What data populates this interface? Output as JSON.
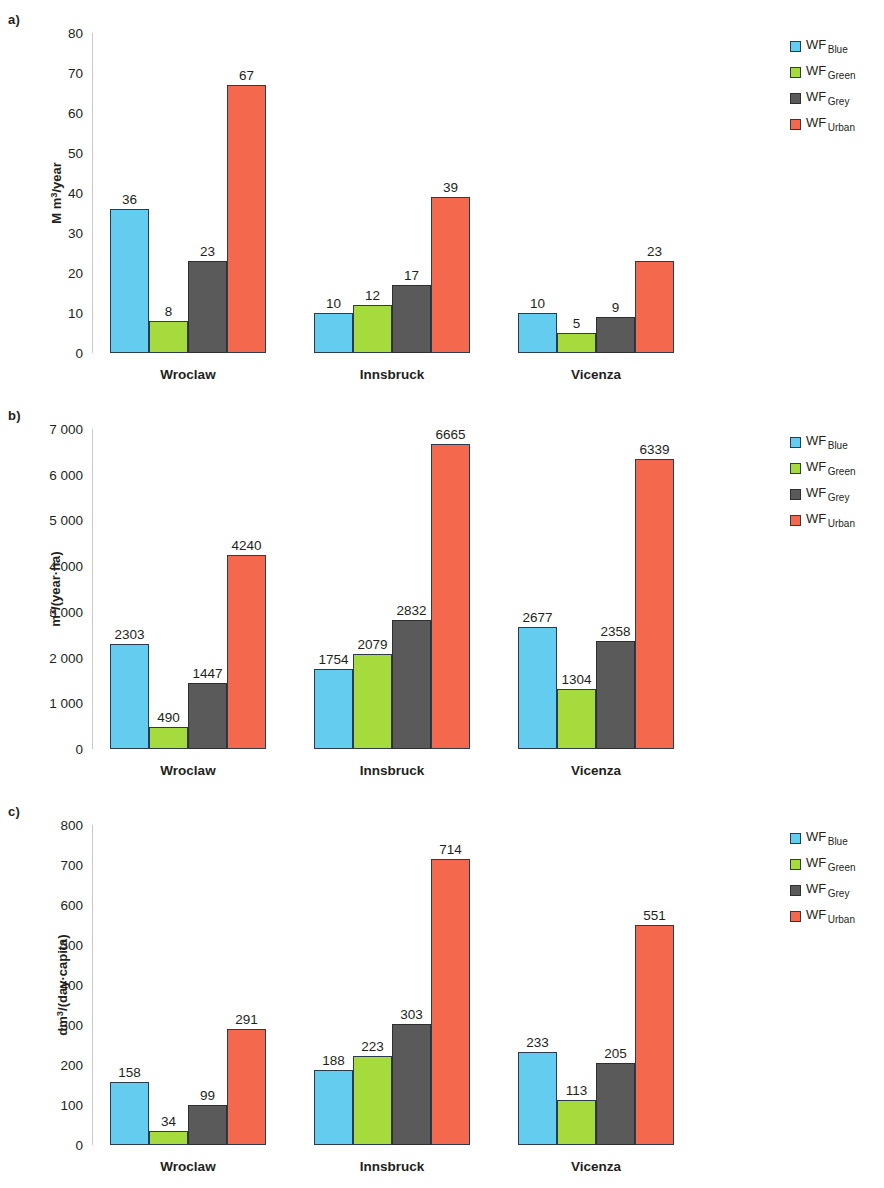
{
  "legend": {
    "position": "right",
    "items": [
      {
        "prefix": "WF",
        "subscript": "Blue",
        "color": "#63ccef",
        "key": "blue"
      },
      {
        "prefix": "WF",
        "subscript": "Green",
        "color": "#a5db3c",
        "key": "green"
      },
      {
        "prefix": "WF",
        "subscript": "Grey",
        "color": "#5a5a5a",
        "key": "grey"
      },
      {
        "prefix": "WF",
        "subscript": "Urban",
        "color": "#f4694d",
        "key": "red"
      }
    ]
  },
  "panels": [
    {
      "id": "a",
      "letter": "a)"
    },
    {
      "id": "b",
      "letter": "b)"
    },
    {
      "id": "c",
      "letter": "c)"
    }
  ],
  "chart_data": [
    {
      "type": "bar",
      "panel": "a)",
      "title": "",
      "xlabel": "",
      "ylabel": "M m³/year",
      "ylabel_parts": {
        "pre": "M m",
        "sup": "3",
        "post": "/year"
      },
      "ylim": [
        0,
        80
      ],
      "yticks": [
        0,
        10,
        20,
        30,
        40,
        50,
        60,
        70,
        80
      ],
      "ytick_labels": [
        "0",
        "10",
        "20",
        "30",
        "40",
        "50",
        "60",
        "70",
        "80"
      ],
      "grid": false,
      "legend_position": "right",
      "categories": [
        "Wroclaw",
        "Innsbruck",
        "Vicenza"
      ],
      "series": [
        {
          "name": "WF Blue",
          "color": "#63ccef",
          "values": [
            36,
            10,
            10
          ]
        },
        {
          "name": "WF Green",
          "color": "#a5db3c",
          "values": [
            8,
            12,
            5
          ]
        },
        {
          "name": "WF Grey",
          "color": "#5a5a5a",
          "values": [
            23,
            17,
            9
          ]
        },
        {
          "name": "WF Urban",
          "color": "#f4694d",
          "values": [
            67,
            39,
            23
          ]
        }
      ]
    },
    {
      "type": "bar",
      "panel": "b)",
      "title": "",
      "xlabel": "",
      "ylabel": "m³/(year·ha)",
      "ylabel_parts": {
        "pre": "m",
        "sup": "3",
        "post": "/(year·ha)"
      },
      "ylim": [
        0,
        7000
      ],
      "yticks": [
        0,
        1000,
        2000,
        3000,
        4000,
        5000,
        6000,
        7000
      ],
      "ytick_labels": [
        "0",
        "1 000",
        "2 000",
        "3 000",
        "4 000",
        "5 000",
        "6 000",
        "7 000"
      ],
      "grid": false,
      "legend_position": "right",
      "categories": [
        "Wroclaw",
        "Innsbruck",
        "Vicenza"
      ],
      "series": [
        {
          "name": "WF Blue",
          "color": "#63ccef",
          "values": [
            2303,
            1754,
            2677
          ]
        },
        {
          "name": "WF Green",
          "color": "#a5db3c",
          "values": [
            490,
            2079,
            1304
          ]
        },
        {
          "name": "WF Grey",
          "color": "#5a5a5a",
          "values": [
            1447,
            2832,
            2358
          ]
        },
        {
          "name": "WF Urban",
          "color": "#f4694d",
          "values": [
            4240,
            6665,
            6339
          ]
        }
      ]
    },
    {
      "type": "bar",
      "panel": "c)",
      "title": "",
      "xlabel": "",
      "ylabel": "dm³/(day·capita)",
      "ylabel_parts": {
        "pre": "dm",
        "sup": "3",
        "post": "/(day·capita)"
      },
      "ylim": [
        0,
        800
      ],
      "yticks": [
        0,
        100,
        200,
        300,
        400,
        500,
        600,
        700,
        800
      ],
      "ytick_labels": [
        "0",
        "100",
        "200",
        "300",
        "400",
        "500",
        "600",
        "700",
        "800"
      ],
      "grid": false,
      "legend_position": "right",
      "categories": [
        "Wroclaw",
        "Innsbruck",
        "Vicenza"
      ],
      "series": [
        {
          "name": "WF Blue",
          "color": "#63ccef",
          "values": [
            158,
            188,
            233
          ]
        },
        {
          "name": "WF Green",
          "color": "#a5db3c",
          "values": [
            34,
            223,
            113
          ]
        },
        {
          "name": "WF Grey",
          "color": "#5a5a5a",
          "values": [
            99,
            303,
            205
          ]
        },
        {
          "name": "WF Urban",
          "color": "#f4694d",
          "values": [
            291,
            714,
            551
          ]
        }
      ]
    }
  ]
}
